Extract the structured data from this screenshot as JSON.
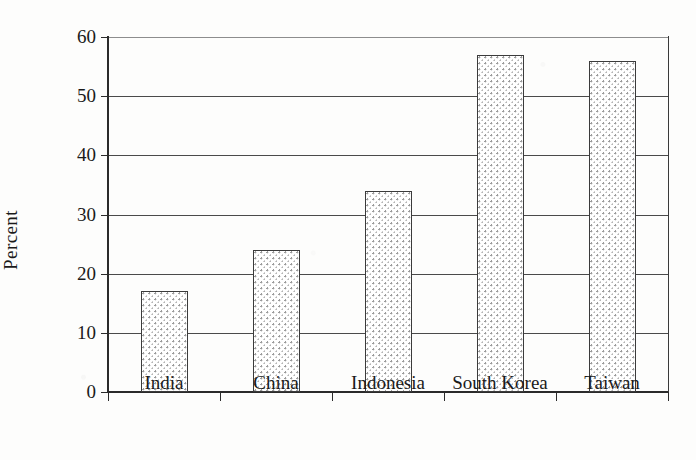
{
  "chart_data": {
    "type": "bar",
    "title": "",
    "xlabel": "",
    "ylabel": "Percent",
    "categories": [
      "India",
      "China",
      "Indonesia",
      "South Korea",
      "Taiwan"
    ],
    "values": [
      17,
      24,
      34,
      57,
      56
    ],
    "ylim": [
      0,
      60
    ],
    "ytick_labels": [
      "0",
      "10",
      "20",
      "30",
      "40",
      "50",
      "60"
    ],
    "ytick_values": [
      0,
      10,
      20,
      30,
      40,
      50,
      60
    ],
    "grid": "horizontal",
    "legend": "none",
    "series": [
      {
        "name": "Percent",
        "values": [
          17,
          24,
          34,
          57,
          56
        ]
      }
    ],
    "bar_fill": "stippled-dot-pattern",
    "bar_edge_color": "#3b3b3b",
    "axis_color": "#2b2b2b",
    "background_color": "#fdfdfc"
  }
}
